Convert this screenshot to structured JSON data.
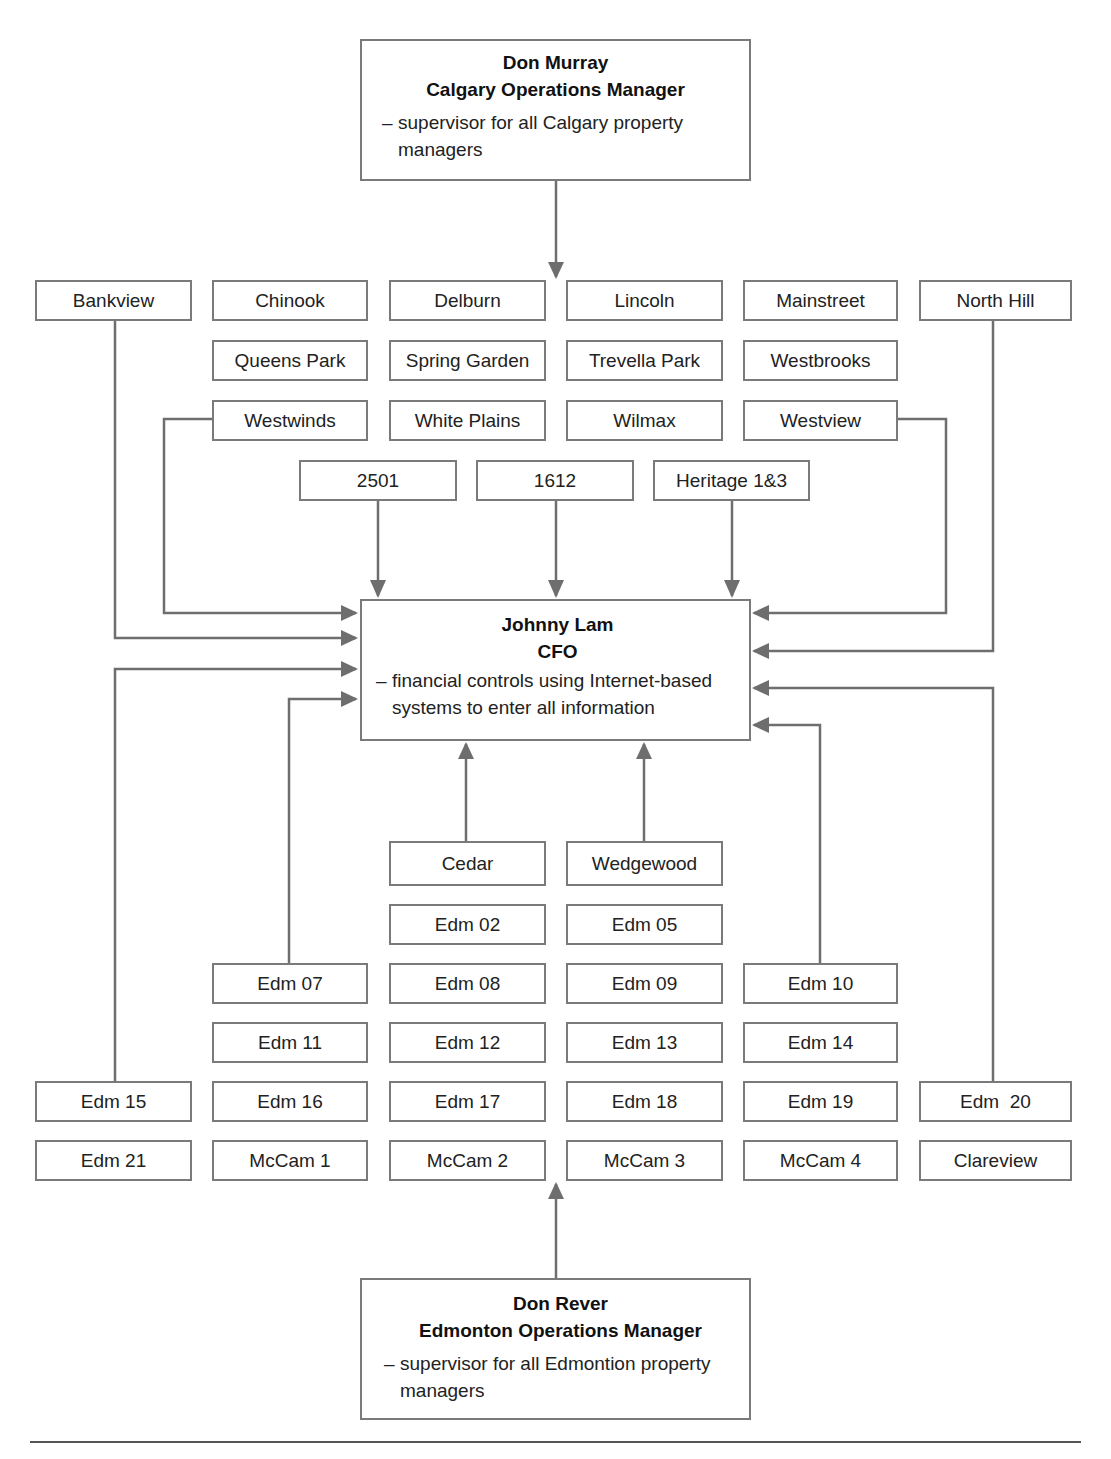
{
  "diagram": {
    "colors": {
      "border": "#7a7a7a",
      "connector": "#6e6e6e",
      "text": "#222222"
    }
  },
  "calgary_manager": {
    "name": "Don Murray",
    "role": "Calgary Operations Manager",
    "dash": "–",
    "description": "supervisor for all Calgary property managers"
  },
  "cfo": {
    "name": "Johnny Lam",
    "role": "CFO",
    "dash": "–",
    "description": "financial controls using Internet-based systems to enter all information"
  },
  "edmonton_manager": {
    "name": "Don Rever",
    "role": "Edmonton Operations Manager",
    "dash": "–",
    "description": "supervisor for all Edmontion property managers"
  },
  "calgary_properties": {
    "row1": [
      "Bankview",
      "Chinook",
      "Delburn",
      "Lincoln",
      "Mainstreet",
      "North Hill"
    ],
    "row2": [
      "Queens Park",
      "Spring Garden",
      "Trevella Park",
      "Westbrooks"
    ],
    "row3": [
      "Westwinds",
      "White Plains",
      "Wilmax",
      "Westview"
    ],
    "row4": [
      "2501",
      "1612",
      "Heritage 1&3"
    ]
  },
  "edmonton_properties": {
    "row1": [
      "Cedar",
      "Wedgewood"
    ],
    "row2": [
      "Edm 02",
      "Edm 05"
    ],
    "row3": [
      "Edm 07",
      "Edm 08",
      "Edm 09",
      "Edm 10"
    ],
    "row4": [
      "Edm 11",
      "Edm 12",
      "Edm 13",
      "Edm 14"
    ],
    "row5": [
      "Edm 15",
      "Edm 16",
      "Edm 17",
      "Edm 18",
      "Edm 19",
      "Edm  20"
    ],
    "row6": [
      "Edm 21",
      "McCam 1",
      "McCam 2",
      "McCam 3",
      "McCam 4",
      "Clareview"
    ]
  }
}
